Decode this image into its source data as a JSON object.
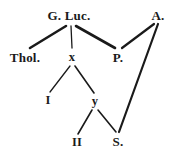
{
  "diagram": {
    "type": "stemma-tree",
    "background_color": "#ffffff",
    "ink_color": "#1a1a1a",
    "nodes": [
      {
        "id": "gluc",
        "label": "G. Luc.",
        "x": 69,
        "y": 15,
        "size": "lg"
      },
      {
        "id": "a",
        "label": "A.",
        "x": 158,
        "y": 15,
        "size": "lg"
      },
      {
        "id": "thol",
        "label": "Thol.",
        "x": 25,
        "y": 57,
        "size": "lg"
      },
      {
        "id": "x",
        "label": "x",
        "x": 72,
        "y": 57,
        "size": "md"
      },
      {
        "id": "p",
        "label": "P.",
        "x": 118,
        "y": 57,
        "size": "lg"
      },
      {
        "id": "i",
        "label": "I",
        "x": 48,
        "y": 100,
        "size": "md"
      },
      {
        "id": "y",
        "label": "y",
        "x": 95,
        "y": 101,
        "size": "md"
      },
      {
        "id": "ii",
        "label": "II",
        "x": 77,
        "y": 142,
        "size": "md"
      },
      {
        "id": "s",
        "label": "S.",
        "x": 118,
        "y": 141,
        "size": "lg"
      }
    ],
    "edges": [
      {
        "id": "gluc-thol",
        "from": "G. Luc.",
        "to": "Thol.",
        "x1": 66,
        "y1": 26,
        "x2": 30,
        "y2": 48,
        "width": 2.6
      },
      {
        "id": "gluc-x",
        "from": "G. Luc.",
        "to": "x",
        "x1": 71,
        "y1": 26,
        "x2": 72,
        "y2": 48,
        "width": 1.3
      },
      {
        "id": "gluc-p",
        "from": "G. Luc.",
        "to": "P.",
        "x1": 76,
        "y1": 26,
        "x2": 115,
        "y2": 48,
        "width": 2.6
      },
      {
        "id": "a-p",
        "from": "A.",
        "to": "P.",
        "x1": 154,
        "y1": 24,
        "x2": 122,
        "y2": 48,
        "width": 2.2
      },
      {
        "id": "a-s",
        "from": "A.",
        "to": "S.",
        "x1": 158,
        "y1": 24,
        "x2": 119,
        "y2": 132,
        "width": 2.2
      },
      {
        "id": "x-i",
        "from": "x",
        "to": "I",
        "x1": 70,
        "y1": 66,
        "x2": 50,
        "y2": 92,
        "width": 1.3
      },
      {
        "id": "x-y",
        "from": "x",
        "to": "y",
        "x1": 75,
        "y1": 66,
        "x2": 94,
        "y2": 93,
        "width": 1.6
      },
      {
        "id": "y-ii",
        "from": "y",
        "to": "II",
        "x1": 92,
        "y1": 110,
        "x2": 78,
        "y2": 134,
        "width": 1.6
      },
      {
        "id": "y-s",
        "from": "y",
        "to": "S.",
        "x1": 98,
        "y1": 110,
        "x2": 116,
        "y2": 132,
        "width": 1.6
      }
    ]
  }
}
